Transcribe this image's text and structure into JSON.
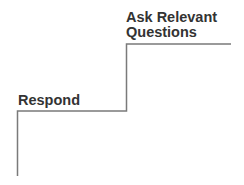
{
  "diagram": {
    "type": "staircase",
    "line_color": "#7a7a7a",
    "text_color": "#333333",
    "steps": [
      {
        "label": "Respond",
        "level": 1
      },
      {
        "label_lines": [
          "Ask Relevant",
          "Questions"
        ],
        "level": 2
      }
    ]
  }
}
